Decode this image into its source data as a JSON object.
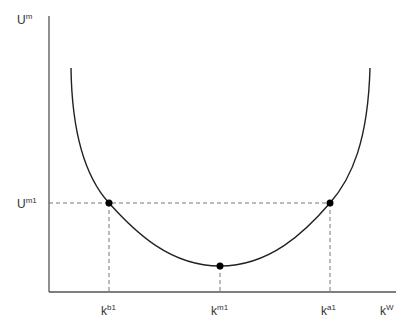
{
  "diagram": {
    "type": "U-shaped utility curve",
    "y_axis_label": {
      "base": "U",
      "sup": "m"
    },
    "x_axis_label": {
      "base": "k",
      "sup": "W"
    },
    "y_ticks": [
      {
        "base": "U",
        "sup": "m1"
      }
    ],
    "x_ticks": [
      {
        "base": "k",
        "sup": "b1"
      },
      {
        "base": "k",
        "sup": "m1"
      },
      {
        "base": "k",
        "sup": "a1"
      }
    ],
    "points": [
      {
        "name": "b1",
        "x_label": "k^b1",
        "y_label": "U^m1"
      },
      {
        "name": "m1",
        "x_label": "k^m1",
        "note": "minimum"
      },
      {
        "name": "a1",
        "x_label": "k^a1",
        "y_label": "U^m1"
      }
    ],
    "colors": {
      "axis": "#555555",
      "curve": "#222222",
      "guide": "#666666",
      "point": "#000000"
    }
  }
}
